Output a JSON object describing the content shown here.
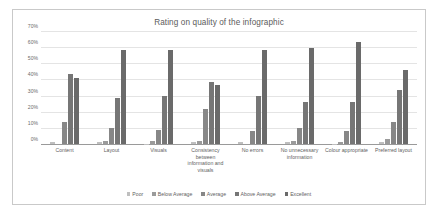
{
  "chart_data": {
    "type": "bar",
    "title": "Rating on quality of the infographic",
    "xlabel": "",
    "ylabel": "",
    "ylim": [
      0,
      70
    ],
    "ytick_labels": [
      "0%",
      "10%",
      "20%",
      "30%",
      "40%",
      "50%",
      "60%",
      "70%"
    ],
    "ytick_values": [
      0,
      10,
      20,
      30,
      40,
      50,
      60,
      70
    ],
    "grid": true,
    "legend_position": "bottom",
    "orientation": "vertical",
    "grouping": "grouped",
    "units": "percent",
    "categories": [
      "Content",
      "Layout",
      "Visuals",
      "Consistency between information and visuals",
      "No errors",
      "No unnecessary information",
      "Colour appropriate",
      "Preferred layout"
    ],
    "series": [
      {
        "name": "Poor",
        "values": [
          1,
          1,
          0,
          1,
          1,
          1,
          0,
          1
        ]
      },
      {
        "name": "Below Average",
        "values": [
          0,
          2,
          2,
          2,
          0,
          2,
          1,
          3
        ]
      },
      {
        "name": "Average",
        "values": [
          14,
          10,
          9,
          22,
          8,
          10,
          8,
          14
        ]
      },
      {
        "name": "Above Average",
        "values": [
          44,
          29,
          30,
          39,
          30,
          26,
          26,
          34
        ]
      },
      {
        "name": "Excellent",
        "values": [
          41,
          59,
          59,
          37,
          59,
          60,
          64,
          46
        ]
      }
    ],
    "colors": {
      "poor": "#bfbfbf",
      "below_average": "#9b9b9b",
      "average": "#878787",
      "above_average": "#767676",
      "excellent": "#6a6a6a",
      "gridline": "#e4e4e4",
      "axis": "#9a9a9a",
      "border": "#c9c9c9",
      "text": "#5f5f5f",
      "background": "#ffffff"
    }
  }
}
